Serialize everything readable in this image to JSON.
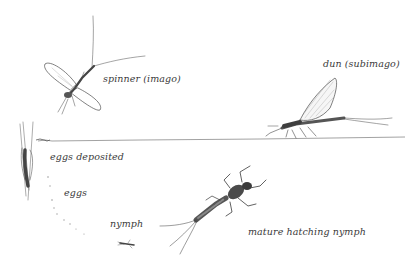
{
  "diagram": {
    "stages": [
      {
        "id": "spinner",
        "label": "spinner (imago)"
      },
      {
        "id": "dun",
        "label": "dun (subimago)"
      },
      {
        "id": "eggs_deposited",
        "label": "eggs deposited"
      },
      {
        "id": "eggs",
        "label": "eggs"
      },
      {
        "id": "nymph",
        "label": "nymph"
      },
      {
        "id": "mature_nymph",
        "label": "mature hatching nymph"
      }
    ],
    "colors": {
      "background": "#ffffff",
      "ink": "#3a3a3a",
      "ink_light": "#9a9a9a",
      "water_line": "#6a6a6a"
    }
  }
}
